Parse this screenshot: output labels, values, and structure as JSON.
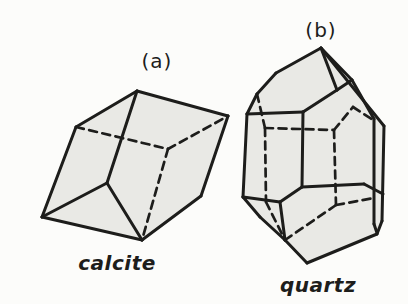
{
  "figure": {
    "type": "crystal-form-diagram",
    "background": "#fcfcfa",
    "ink": "#1d1d1b",
    "face_fill": "#e9e9e5",
    "panels": [
      {
        "id": "calcite",
        "tag": "(a)",
        "caption": "calcite",
        "silhouette": [
          [
            137,
            91
          ],
          [
            228,
            116
          ],
          [
            201,
            196
          ],
          [
            142,
            240
          ],
          [
            42,
            217
          ],
          [
            76,
            127
          ]
        ],
        "solid_edges": [
          [
            137,
            91,
            76,
            127
          ],
          [
            137,
            91,
            228,
            116
          ],
          [
            137,
            91,
            107,
            183
          ],
          [
            76,
            127,
            42,
            217
          ],
          [
            42,
            217,
            107,
            183
          ],
          [
            42,
            217,
            142,
            240
          ],
          [
            107,
            183,
            142,
            240
          ],
          [
            142,
            240,
            201,
            196
          ],
          [
            201,
            196,
            228,
            116
          ]
        ],
        "dashed_edges": [
          [
            76,
            127,
            168,
            149
          ],
          [
            168,
            149,
            228,
            116
          ],
          [
            168,
            149,
            142,
            240
          ]
        ]
      },
      {
        "id": "quartz",
        "tag": "(b)",
        "caption": "quartz",
        "silhouette": [
          [
            321,
            48
          ],
          [
            384,
            126
          ],
          [
            382,
            221
          ],
          [
            377,
            234
          ],
          [
            307,
            263
          ],
          [
            285,
            240
          ],
          [
            260,
            217
          ],
          [
            243,
            197
          ],
          [
            247,
            114
          ],
          [
            257,
            94
          ],
          [
            276,
            73
          ]
        ],
        "solid_edges": [
          [
            321,
            48,
            276,
            73
          ],
          [
            276,
            73,
            257,
            94
          ],
          [
            257,
            94,
            247,
            114
          ],
          [
            321,
            48,
            337,
            90
          ],
          [
            321,
            48,
            352,
            80
          ],
          [
            337,
            90,
            352,
            80
          ],
          [
            321,
            48,
            384,
            126
          ],
          [
            352,
            80,
            374,
            119
          ],
          [
            247,
            114,
            303,
            112
          ],
          [
            303,
            112,
            337,
            90
          ],
          [
            247,
            114,
            243,
            197
          ],
          [
            303,
            112,
            302,
            187
          ],
          [
            374,
            119,
            374,
            224
          ],
          [
            384,
            126,
            382,
            221
          ],
          [
            243,
            197,
            260,
            217
          ],
          [
            260,
            217,
            285,
            240
          ],
          [
            285,
            240,
            307,
            263
          ],
          [
            243,
            197,
            280,
            202
          ],
          [
            280,
            202,
            285,
            240
          ],
          [
            302,
            187,
            280,
            202
          ],
          [
            302,
            187,
            364,
            184
          ],
          [
            364,
            184,
            383,
            194
          ],
          [
            382,
            221,
            377,
            234
          ],
          [
            377,
            234,
            307,
            263
          ],
          [
            374,
            224,
            377,
            233
          ]
        ],
        "dashed_edges": [
          [
            257,
            94,
            265,
            128
          ],
          [
            265,
            128,
            266,
            202
          ],
          [
            266,
            202,
            285,
            240
          ],
          [
            265,
            128,
            334,
            130
          ],
          [
            334,
            130,
            336,
            205
          ],
          [
            336,
            205,
            285,
            240
          ],
          [
            334,
            130,
            353,
            107
          ],
          [
            353,
            107,
            373,
            120
          ],
          [
            336,
            205,
            374,
            198
          ]
        ]
      }
    ]
  }
}
